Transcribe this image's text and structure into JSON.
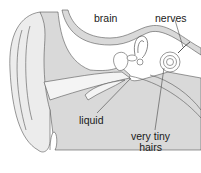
{
  "diagram": {
    "labels": {
      "brain": "brain",
      "nerves": "nerves",
      "liquid": "liquid",
      "hairs_line1": "very tiny",
      "hairs_line2": "hairs"
    },
    "colors": {
      "tissue_fill": "#d9d9d9",
      "outer_ear_fill": "#ececec",
      "outline": "#555555",
      "background": "#ffffff"
    }
  }
}
